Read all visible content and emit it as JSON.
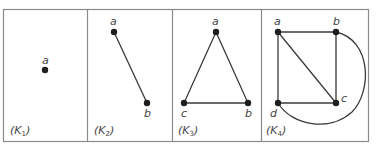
{
  "figure": {
    "border_color": "#8a8a8a",
    "edge_color": "#3a3a3a",
    "vertex_color": "#1e1e1e"
  },
  "panels": [
    {
      "id": "K1",
      "label_main": "K",
      "label_sub": "1",
      "vertices": [
        {
          "name": "a",
          "x": 45,
          "y": 70
        }
      ],
      "edges": []
    },
    {
      "id": "K2",
      "label_main": "K",
      "label_sub": "2",
      "vertices": [
        {
          "name": "a",
          "x": 114,
          "y": 32
        },
        {
          "name": "b",
          "x": 147,
          "y": 103
        }
      ],
      "edges": [
        [
          "a",
          "b"
        ]
      ]
    },
    {
      "id": "K3",
      "label_main": "K",
      "label_sub": "3",
      "vertices": [
        {
          "name": "a",
          "x": 216,
          "y": 32
        },
        {
          "name": "b",
          "x": 248,
          "y": 103
        },
        {
          "name": "c",
          "x": 184,
          "y": 103
        }
      ],
      "edges": [
        [
          "a",
          "b"
        ],
        [
          "b",
          "c"
        ],
        [
          "c",
          "a"
        ]
      ]
    },
    {
      "id": "K4",
      "label_main": "K",
      "label_sub": "4",
      "vertices": [
        {
          "name": "a",
          "x": 278,
          "y": 32
        },
        {
          "name": "b",
          "x": 336,
          "y": 32
        },
        {
          "name": "c",
          "x": 336,
          "y": 103
        },
        {
          "name": "d",
          "x": 278,
          "y": 103
        }
      ],
      "edges": [
        [
          "a",
          "b"
        ],
        [
          "b",
          "c"
        ],
        [
          "c",
          "d"
        ],
        [
          "d",
          "a"
        ],
        [
          "a",
          "c"
        ],
        [
          "b",
          "d"
        ]
      ]
    }
  ],
  "labels": {
    "k1_a": "a",
    "k2_a": "a",
    "k2_b": "b",
    "k3_a": "a",
    "k3_b": "b",
    "k3_c": "c",
    "k4_a": "a",
    "k4_b": "b",
    "k4_c": "c",
    "k4_d": "d",
    "open_paren": "(",
    "close_paren": ")",
    "k": "K",
    "sub1": "1",
    "sub2": "2",
    "sub3": "3",
    "sub4": "4"
  }
}
